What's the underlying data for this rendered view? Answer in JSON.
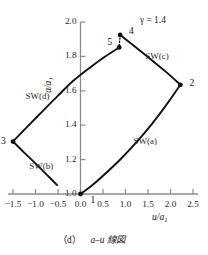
{
  "figure": {
    "caption": "（d） a–u 線図",
    "caption_index": "（d）",
    "caption_body": "a–u 線図",
    "annotation_gamma": "γ = 1.4"
  },
  "chart_data": {
    "type": "line",
    "title": "",
    "subtitle": "",
    "xlabel": "u/a1",
    "ylabel": "a/a1",
    "xlim": [
      -1.75,
      2.75
    ],
    "ylim": [
      0.95,
      2.05
    ],
    "grid": false,
    "legend_position": "none",
    "xticks": [
      -1.5,
      -1.0,
      -0.5,
      0.0,
      0.5,
      1.0,
      1.5,
      2.0,
      2.5
    ],
    "xtick_labels": [
      "−1.5",
      "−1.0",
      "−0.5",
      "0.0",
      "0.5",
      "1.0",
      "1.5",
      "2.0",
      "2.5"
    ],
    "yticks": [
      1.0,
      1.2,
      1.4,
      1.6,
      1.8,
      2.0
    ],
    "ytick_labels": [
      "1.0",
      "1.2",
      "1.4",
      "1.6",
      "1.8",
      "2.0"
    ],
    "annotations": [
      {
        "text": "γ = 1.4",
        "x": 1.55,
        "y": 1.97
      }
    ],
    "points": [
      {
        "label": "1",
        "x": 0.0,
        "y": 1.0,
        "marker": true,
        "label_dx": 10,
        "label_dy": 6
      },
      {
        "label": "2",
        "x": 2.22,
        "y": 1.635,
        "marker": true,
        "label_dx": 9,
        "label_dy": -2
      },
      {
        "label": "3",
        "x": -1.5,
        "y": 1.305,
        "marker": true,
        "label_dx": -12,
        "label_dy": -1
      },
      {
        "label": "4",
        "x": 0.88,
        "y": 1.925,
        "marker": true,
        "label_dx": 9,
        "label_dy": -4
      },
      {
        "label": "5",
        "x": 0.86,
        "y": 1.852,
        "marker": true,
        "label_dx": -12,
        "label_dy": -5
      }
    ],
    "series": [
      {
        "name": "SW(a)",
        "style": "solid",
        "label_x": 1.18,
        "label_y": 1.3,
        "from": "1",
        "to": "2",
        "x": [
          0.0,
          0.28,
          0.58,
          0.9,
          1.24,
          1.58,
          1.9,
          2.22
        ],
        "y": [
          1.0,
          1.055,
          1.125,
          1.205,
          1.3,
          1.405,
          1.515,
          1.635
        ]
      },
      {
        "name": "SW(c)",
        "style": "solid",
        "label_x": 1.44,
        "label_y": 1.795,
        "from": "4",
        "to": "2",
        "x": [
          0.88,
          1.22,
          1.56,
          1.9,
          2.22
        ],
        "y": [
          1.925,
          1.855,
          1.783,
          1.71,
          1.635
        ]
      },
      {
        "name": "SW(d)",
        "style": "solid",
        "label_x": -1.22,
        "label_y": 1.565,
        "from": "3",
        "to": "5",
        "x": [
          -1.5,
          -1.18,
          -0.84,
          -0.5,
          -0.16,
          0.2,
          0.54,
          0.86
        ],
        "y": [
          1.305,
          1.392,
          1.482,
          1.572,
          1.658,
          1.733,
          1.798,
          1.852
        ]
      },
      {
        "name": "SW(b)",
        "style": "solid",
        "label_x": -1.14,
        "label_y": 1.155,
        "from": "3",
        "to": "1",
        "x": [
          -1.5,
          -1.24,
          -0.98,
          -0.74,
          -0.52
        ],
        "y": [
          1.305,
          1.238,
          1.172,
          1.11,
          1.052
        ]
      },
      {
        "name": "4-5 link",
        "style": "dotted",
        "from": "4",
        "to": "5",
        "x": [
          0.88,
          0.86
        ],
        "y": [
          1.925,
          1.852
        ]
      }
    ]
  },
  "axes": {
    "x_axis_label": "u/a1",
    "x_axis_label_main": "u/a",
    "x_axis_label_sub": "1",
    "y_axis_label_main": "a/a",
    "y_axis_label_sub": "1"
  }
}
